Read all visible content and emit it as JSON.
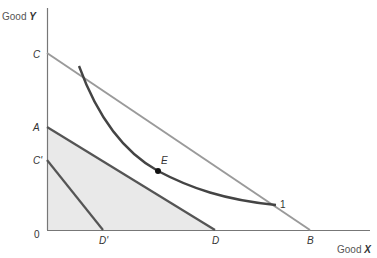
{
  "diagram": {
    "type": "economics-indifference-budget",
    "axes": {
      "y_label_prefix": "Good ",
      "y_label_var": "Y",
      "x_label_prefix": "Good ",
      "x_label_var": "X",
      "origin_label": "0"
    },
    "points": {
      "C": "C",
      "A": "A",
      "C_prime": "C'",
      "D_prime": "D'",
      "D": "D",
      "B": "B",
      "E": "E"
    },
    "lines": [
      {
        "name": "CB",
        "from": "C",
        "to": "B",
        "color": "#9a9a9a"
      },
      {
        "name": "AD",
        "from": "A",
        "to": "D",
        "color": "#555555"
      },
      {
        "name": "C'D'",
        "from": "C'",
        "to": "D'",
        "color": "#555555"
      }
    ],
    "indifference_curve": {
      "label": "1",
      "color": "#444444"
    },
    "shaded_region": {
      "vertices": [
        "0",
        "A",
        "D"
      ],
      "color": "#e9e9e9"
    },
    "tangency_point": "E",
    "colors": {
      "axis": "#777777",
      "shade": "#e9e9e9",
      "light_line": "#9a9a9a",
      "dark_line": "#555555",
      "curve": "#444444",
      "point": "#111111"
    }
  }
}
